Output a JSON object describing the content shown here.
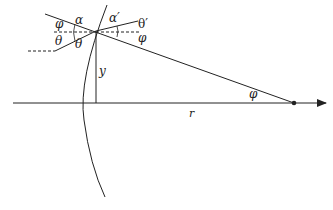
{
  "diagram": {
    "type": "optics-refraction-geometry",
    "labels": {
      "phi_left": "φ",
      "alpha": "α",
      "theta_left_upper": "θ",
      "theta_left_lower": "θ",
      "alpha_prime": "α′",
      "theta_prime": "θ′",
      "phi_right": "φ",
      "y": "y",
      "phi_axis": "φ",
      "r": "r"
    },
    "colors": {
      "line": "#222222",
      "background": "#ffffff"
    }
  }
}
